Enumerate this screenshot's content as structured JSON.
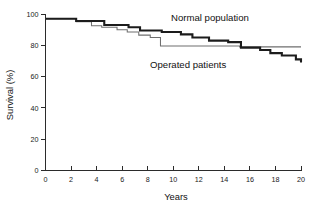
{
  "chart_data": {
    "type": "line",
    "title": "",
    "subtitle": "",
    "xlabel": "Years",
    "ylabel": "Survival (%)",
    "xlim": [
      0,
      20
    ],
    "ylim": [
      0,
      100
    ],
    "xticks": [
      0,
      2,
      4,
      6,
      8,
      10,
      12,
      14,
      16,
      18,
      20
    ],
    "yticks": [
      0,
      20,
      40,
      60,
      80,
      100
    ],
    "xtick_labels": [
      "0",
      "2",
      "4",
      "6",
      "8",
      "10",
      "12",
      "14",
      "16",
      "18",
      "20"
    ],
    "ytick_labels": [
      "0",
      "20",
      "40",
      "60",
      "80",
      "100"
    ],
    "grid": false,
    "legend_position": "inline-annotation",
    "step_style": "post",
    "series": [
      {
        "name": "Normal population",
        "style": "thin-gray-step",
        "color": "#6f6f6f",
        "annotation_text": "Normal population",
        "x": [
          0,
          2.4,
          3.6,
          4.4,
          5.6,
          6.4,
          7.3,
          8.2,
          9.0,
          15.2,
          20
        ],
        "values": [
          97,
          95,
          92.5,
          91.5,
          90,
          88.5,
          86.5,
          85,
          79.5,
          79,
          79
        ]
      },
      {
        "name": "Operated patients",
        "style": "thick-black-step",
        "color": "#1c1c1c",
        "annotation_text": "Operated patients",
        "x": [
          0,
          2.4,
          4.6,
          6.5,
          7.4,
          9.1,
          10.6,
          11.5,
          12.8,
          14.3,
          15.3,
          16.8,
          17.6,
          18.5,
          19.6,
          20
        ],
        "values": [
          97,
          95.5,
          93,
          91.5,
          89.5,
          88.5,
          87,
          85,
          83,
          82,
          78.5,
          77,
          75,
          73.5,
          71,
          69
        ]
      }
    ],
    "annotations": [
      {
        "text": "Normal population",
        "x_frac": 0.52,
        "y_frac": 0.065,
        "series": "Normal population"
      },
      {
        "text": "Operated patients",
        "x_frac": 0.52,
        "y_frac": 0.3,
        "series": "Operated patients"
      }
    ]
  }
}
